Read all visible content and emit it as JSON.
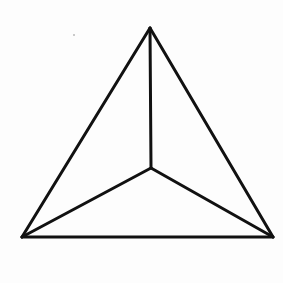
{
  "diagram": {
    "type": "tetrahedron-projection",
    "stroke_color": "#111111",
    "background_color": "#fdfdfd",
    "stroke_width": 3,
    "vertices": {
      "apex": [
        150,
        28
      ],
      "bottom_left": [
        22,
        237
      ],
      "bottom_right": [
        273,
        237
      ],
      "center": [
        151,
        168
      ]
    },
    "edges": [
      {
        "name": "left-edge",
        "from": "apex",
        "to": "bottom_left"
      },
      {
        "name": "right-edge",
        "from": "apex",
        "to": "bottom_right"
      },
      {
        "name": "base-edge",
        "from": "bottom_left",
        "to": "bottom_right"
      },
      {
        "name": "vertical-edge",
        "from": "apex",
        "to": "center"
      },
      {
        "name": "left-inner-edge",
        "from": "center",
        "to": "bottom_left"
      },
      {
        "name": "right-inner-edge",
        "from": "center",
        "to": "bottom_right"
      }
    ],
    "speck": [
      74,
      35
    ]
  }
}
